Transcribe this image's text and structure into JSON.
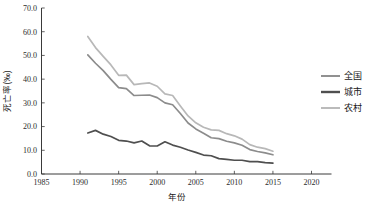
{
  "chart_data": {
    "type": "line",
    "title": "",
    "xlabel": "年份",
    "ylabel": "死亡率(‰)",
    "xlim": [
      1985,
      2020
    ],
    "ylim": [
      0.0,
      70.0
    ],
    "xticks": [
      "1985",
      "1990",
      "1995",
      "2000",
      "2005",
      "2010",
      "2015",
      "2020"
    ],
    "yticks": [
      "0.0",
      "10.0",
      "20.0",
      "30.0",
      "40.0",
      "50.0",
      "60.0",
      "70.0"
    ],
    "grid": false,
    "legend_position": "right",
    "x": [
      1991,
      1992,
      1993,
      1994,
      1995,
      1996,
      1997,
      1998,
      1999,
      2000,
      2001,
      2002,
      2003,
      2004,
      2005,
      2006,
      2007,
      2008,
      2009,
      2010,
      2011,
      2012,
      2013,
      2014,
      2015
    ],
    "series": [
      {
        "name": "全国",
        "color": "#8c8c8c",
        "values": [
          50.2,
          46.7,
          43.6,
          39.9,
          36.4,
          36.0,
          33.1,
          33.2,
          33.3,
          32.2,
          30.0,
          29.2,
          25.5,
          21.5,
          19.0,
          17.2,
          15.3,
          14.9,
          13.8,
          13.1,
          12.1,
          10.3,
          9.5,
          8.9,
          8.1
        ]
      },
      {
        "name": "城市",
        "color": "#4f4f4f",
        "values": [
          17.3,
          18.4,
          16.8,
          15.8,
          14.2,
          13.9,
          13.1,
          13.9,
          11.9,
          11.8,
          13.6,
          12.2,
          11.3,
          10.1,
          9.1,
          8.0,
          7.7,
          6.5,
          6.2,
          5.8,
          5.8,
          5.2,
          5.2,
          4.8,
          4.6
        ]
      },
      {
        "name": "农村",
        "color": "#b8b8b8",
        "values": [
          58.0,
          53.3,
          49.6,
          46.0,
          41.6,
          41.7,
          37.7,
          38.1,
          38.4,
          37.0,
          33.8,
          33.1,
          28.7,
          24.5,
          21.6,
          19.7,
          18.6,
          18.4,
          17.0,
          16.1,
          14.7,
          12.4,
          11.3,
          10.7,
          9.6
        ]
      }
    ]
  },
  "legend": {
    "items": [
      {
        "label": "全国",
        "color": "#8c8c8c"
      },
      {
        "label": "城市",
        "color": "#4f4f4f"
      },
      {
        "label": "农村",
        "color": "#b8b8b8"
      }
    ]
  },
  "axes": {
    "y_title": "死亡率(‰)",
    "x_title": "年份"
  },
  "colors": {
    "axis": "#3a3a3a",
    "text": "#1a1a1a",
    "background": "#ffffff"
  }
}
